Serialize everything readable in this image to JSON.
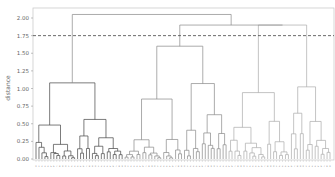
{
  "chart_data": {
    "type": "dendrogram",
    "title": "",
    "xlabel": "",
    "ylabel": "distance",
    "ylim": [
      0,
      2.1
    ],
    "yticks": [
      0.0,
      0.25,
      0.5,
      0.75,
      1.0,
      1.25,
      1.5,
      1.75,
      2.0
    ],
    "ytick_labels": [
      "0.00",
      "0.25",
      "0.50",
      "0.75",
      "1.00",
      "1.25",
      "1.50",
      "1.75",
      "2.00"
    ],
    "cut_line": {
      "y": 1.75,
      "style": "dashed"
    },
    "n_leaves": 100,
    "clusters": [
      {
        "name": "left",
        "color": "#444444",
        "leaf_range": [
          0,
          29
        ],
        "merge_height": 1.08
      },
      {
        "name": "middle",
        "color": "#888888",
        "leaf_range": [
          30,
          64
        ],
        "merge_height": 1.6
      },
      {
        "name": "right",
        "color": "#aaaaaa",
        "leaf_range": [
          65,
          99
        ],
        "merge_height": 1.9
      }
    ],
    "top_merges": [
      {
        "height": 2.05,
        "joins": [
          "left",
          "middle+right"
        ]
      },
      {
        "height": 1.9,
        "joins": [
          "middle",
          "right"
        ]
      }
    ]
  },
  "axis": {
    "ylabel": "distance"
  }
}
